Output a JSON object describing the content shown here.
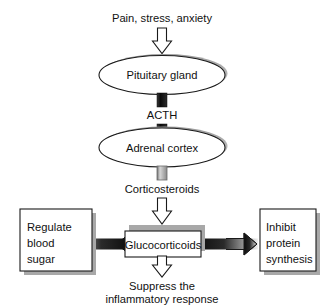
{
  "diagram": {
    "title_text": "Pain, stress, anxiety",
    "nodes": {
      "stimulus": {
        "label": "Pain, stress, anxiety",
        "kind": "plain-text"
      },
      "pituitary": {
        "label": "Pituitary gland",
        "kind": "ellipse"
      },
      "acth": {
        "label": "ACTH",
        "kind": "plain-text"
      },
      "adrenal": {
        "label": "Adrenal cortex",
        "kind": "ellipse"
      },
      "corticosteroids": {
        "label": "Corticosteroids",
        "kind": "plain-text"
      },
      "glucocorticoids": {
        "label": "Glucocorticoids",
        "kind": "box"
      },
      "regulate_blood_sugar": {
        "label": "Regulate blood sugar",
        "line1": "Regulate",
        "line2": "blood",
        "line3": "sugar",
        "kind": "box"
      },
      "inhibit_protein_synthesis": {
        "label": "Inhibit protein synthesis",
        "line1": "Inhibit",
        "line2": "protein",
        "line3": "synthesis",
        "kind": "box"
      },
      "suppress_inflammatory": {
        "label": "Suppress the inflammatory response",
        "line1": "Suppress the",
        "line2": "inflammatory response",
        "kind": "plain-text"
      }
    },
    "edges": [
      {
        "from": "stimulus",
        "to": "pituitary",
        "style": "hollow-down-arrow"
      },
      {
        "from": "pituitary",
        "to": "acth",
        "style": "dark-bar"
      },
      {
        "from": "acth",
        "to": "adrenal",
        "style": "dark-bar"
      },
      {
        "from": "adrenal",
        "to": "corticosteroids",
        "style": "light-bar"
      },
      {
        "from": "corticosteroids",
        "to": "glucocorticoids",
        "style": "hollow-down-arrow"
      },
      {
        "from": "glucocorticoids",
        "to": "regulate_blood_sugar",
        "style": "hollow-left-arrow-gradient"
      },
      {
        "from": "glucocorticoids",
        "to": "inhibit_protein_synthesis",
        "style": "hollow-right-arrow-gradient"
      },
      {
        "from": "glucocorticoids",
        "to": "suppress_inflammatory",
        "style": "hollow-down-arrow"
      }
    ],
    "colors": {
      "background": "#ffffff",
      "stroke": "#1a1a1a",
      "text": "#111111",
      "shadow": "#a8a8a8",
      "dark_connector": "#151515",
      "light_connector": "#c9c9c9"
    }
  }
}
